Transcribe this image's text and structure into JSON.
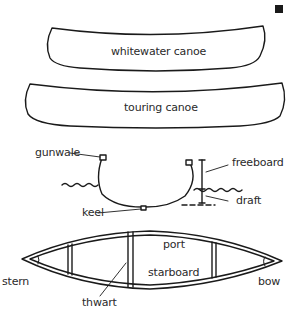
{
  "diagram": {
    "colors": {
      "stroke": "#1a1a1a",
      "text": "#2a2a2a",
      "background": "#ffffff"
    },
    "marker_icon": "black-square",
    "side_profiles": [
      {
        "label": "whitewater canoe"
      },
      {
        "label": "touring canoe"
      }
    ],
    "cross_section": {
      "labels": {
        "gunwale": "gunwale",
        "keel": "keel",
        "freeboard": "freeboard",
        "draft": "draft"
      }
    },
    "top_view": {
      "labels": {
        "port": "port",
        "starboard": "starboard",
        "stern": "stern",
        "bow": "bow",
        "thwart": "thwart"
      }
    }
  }
}
